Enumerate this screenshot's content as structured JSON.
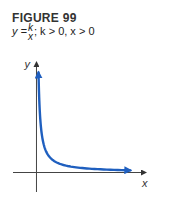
{
  "figure": {
    "title": "FIGURE 99",
    "equation": {
      "lhs": "y =",
      "numerator": "k",
      "denominator": "x",
      "conditions": "; k > 0, x > 0"
    }
  },
  "chart_data": {
    "type": "line",
    "title": "FIGURE 99",
    "subtitle": "y = k/x; k > 0, x > 0",
    "xlabel": "x",
    "ylabel": "y",
    "function": "y = k/x",
    "k": 1,
    "series": [
      {
        "name": "y = k/x",
        "color": "#1f5fbf",
        "x": [
          0.13,
          0.16,
          0.2,
          0.25,
          0.33,
          0.5,
          0.75,
          1,
          1.5,
          2,
          3,
          4,
          5,
          6
        ],
        "values": [
          7.7,
          6.25,
          5,
          4,
          3,
          2,
          1.33,
          1,
          0.67,
          0.5,
          0.33,
          0.25,
          0.2,
          0.17
        ]
      }
    ],
    "xlim": [
      -1.5,
      7
    ],
    "ylim": [
      -1.5,
      8.5
    ],
    "grid": false,
    "axis_color": "#444444",
    "arrows_on_ends": true
  }
}
